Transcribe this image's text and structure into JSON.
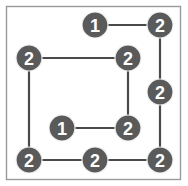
{
  "figure": {
    "width": 188,
    "height": 186,
    "background_color": "#ffffff",
    "frame": {
      "x": 6.5,
      "y": 6.5,
      "width": 174,
      "height": 173,
      "stroke_color": "#9a9a9a",
      "stroke_width": 1.4
    }
  },
  "style": {
    "node_fill": "#5a5a5a",
    "node_ring_color": "#f0f0f0",
    "node_label_color": "#ffffff",
    "node_radius": 13,
    "node_font_size": 18,
    "edge_color": "#4a4a4a",
    "edge_width": 2.2
  },
  "chart_data": {
    "type": "diagram",
    "title": "",
    "xlabel": "",
    "ylabel": "",
    "node_labels_present": [
      "1",
      "2"
    ],
    "node_count": 9,
    "edge_count": 9,
    "label_counts": {
      "1": 2,
      "2": 7
    },
    "nodes": [
      {
        "id": "n1",
        "label": "1",
        "x": 95,
        "y": 25
      },
      {
        "id": "n2",
        "label": "2",
        "x": 160,
        "y": 25
      },
      {
        "id": "n3",
        "label": "2",
        "x": 29,
        "y": 58
      },
      {
        "id": "n4",
        "label": "2",
        "x": 128,
        "y": 58
      },
      {
        "id": "n5",
        "label": "2",
        "x": 160,
        "y": 92
      },
      {
        "id": "n6",
        "label": "1",
        "x": 62,
        "y": 128
      },
      {
        "id": "n7",
        "label": "2",
        "x": 128,
        "y": 128
      },
      {
        "id": "n8",
        "label": "2",
        "x": 29,
        "y": 160
      },
      {
        "id": "n9",
        "label": "2",
        "x": 95,
        "y": 160
      },
      {
        "id": "n10",
        "label": "2",
        "x": 160,
        "y": 160
      }
    ],
    "edges": [
      {
        "source": "n1",
        "target": "n2",
        "x1": 95,
        "y1": 25,
        "x2": 160,
        "y2": 25
      },
      {
        "source": "n2",
        "target": "n5",
        "x1": 160,
        "y1": 25,
        "x2": 160,
        "y2": 92
      },
      {
        "source": "n5",
        "target": "n10",
        "x1": 160,
        "y1": 92,
        "x2": 160,
        "y2": 160
      },
      {
        "source": "n3",
        "target": "n4",
        "x1": 29,
        "y1": 58,
        "x2": 128,
        "y2": 58
      },
      {
        "source": "n4",
        "target": "n7",
        "x1": 128,
        "y1": 58,
        "x2": 128,
        "y2": 128
      },
      {
        "source": "n6",
        "target": "n7",
        "x1": 62,
        "y1": 128,
        "x2": 128,
        "y2": 128
      },
      {
        "source": "n3",
        "target": "n8",
        "x1": 29,
        "y1": 58,
        "x2": 29,
        "y2": 160
      },
      {
        "source": "n8",
        "target": "n9",
        "x1": 29,
        "y1": 160,
        "x2": 95,
        "y2": 160
      },
      {
        "source": "n9",
        "target": "n10",
        "x1": 95,
        "y1": 160,
        "x2": 160,
        "y2": 160
      }
    ]
  }
}
